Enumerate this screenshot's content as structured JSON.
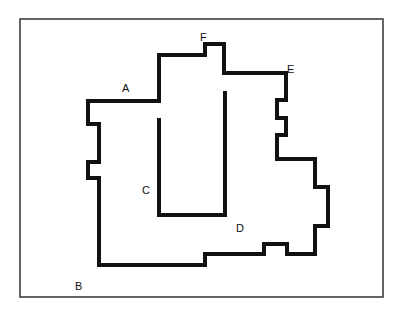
{
  "diagram": {
    "labels": {
      "A": "A",
      "B": "B",
      "C": "C",
      "D": "D",
      "E": "E",
      "F": "F"
    },
    "colors": {
      "stroke": "#111111",
      "frame": "#333333",
      "background": "#ffffff"
    }
  }
}
